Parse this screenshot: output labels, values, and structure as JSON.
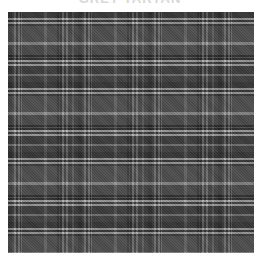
{
  "caption": {
    "text": "GREY TARTAN",
    "visible": "partially cut off at top edge"
  },
  "image": {
    "subject": "grayscale tartan plaid fabric texture",
    "pattern": "plaid",
    "repeat_px": 70,
    "colors": {
      "base": "#454545",
      "dark": "#1e1e1e",
      "mid": "#555555",
      "light": "#9a9a9a",
      "white_stripe": "#d0d0d0",
      "background": "#ffffff"
    }
  }
}
